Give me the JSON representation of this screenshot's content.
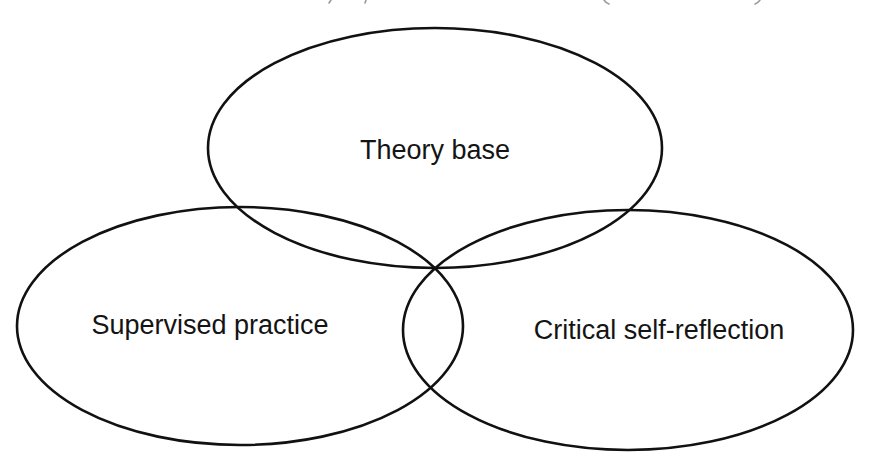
{
  "diagram": {
    "type": "venn",
    "stroke_color": "#111111",
    "background_color": "#ffffff",
    "sets": [
      {
        "id": "theory",
        "label": "Theory base",
        "center": [
          435,
          148
        ],
        "radii": [
          227,
          120
        ],
        "label_pos": [
          435,
          150
        ]
      },
      {
        "id": "practice",
        "label": "Supervised practice",
        "center": [
          240,
          326
        ],
        "radii": [
          223,
          119
        ],
        "label_pos": [
          210,
          325
        ]
      },
      {
        "id": "reflection",
        "label": "Critical self-reflection",
        "center": [
          628,
          330
        ],
        "radii": [
          225,
          120
        ],
        "label_pos": [
          659,
          330
        ]
      }
    ],
    "intersection_point": [
      434,
      267
    ]
  }
}
